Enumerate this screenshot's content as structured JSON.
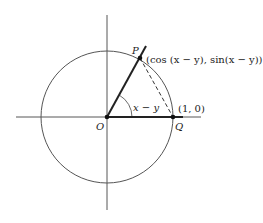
{
  "diagram": {
    "type": "unit-circle",
    "points": {
      "origin": {
        "label": "O"
      },
      "p": {
        "label": "P",
        "coords_label": "(cos (x − y), sin(x − y))"
      },
      "q": {
        "label": "Q",
        "coords_label": "(1, 0)"
      }
    },
    "angle_label": "x − y",
    "colors": {
      "stroke": "#333333",
      "thick": "#222222"
    }
  }
}
